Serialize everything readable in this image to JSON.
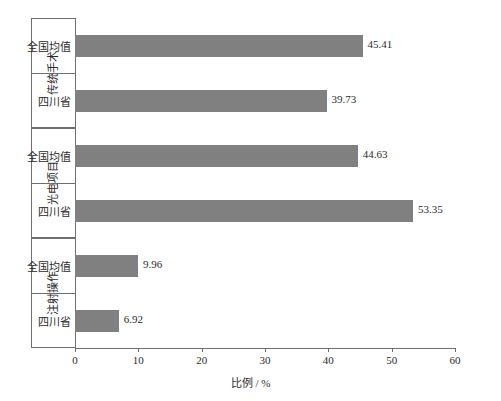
{
  "chart_data": {
    "type": "bar",
    "orientation": "horizontal",
    "title": "",
    "xlabel": "比例 / %",
    "ylabel": "",
    "xlim": [
      0,
      60
    ],
    "xticks": [
      0,
      10,
      20,
      30,
      40,
      50,
      60
    ],
    "grid": false,
    "legend": "none",
    "bar_color": "#808080",
    "groups": [
      {
        "name": "传统手术",
        "categories": [
          "全国均值",
          "四川省"
        ],
        "values": [
          45.41,
          39.73
        ],
        "labels": [
          "45.41",
          "39.73"
        ]
      },
      {
        "name": "光电项目",
        "categories": [
          "全国均值",
          "四川省"
        ],
        "values": [
          44.63,
          53.35
        ],
        "labels": [
          "44.63",
          "53.35"
        ]
      },
      {
        "name": "注射操作",
        "categories": [
          "全国均值",
          "四川省"
        ],
        "values": [
          9.96,
          6.92
        ],
        "labels": [
          "9.96",
          "6.92"
        ]
      }
    ]
  }
}
